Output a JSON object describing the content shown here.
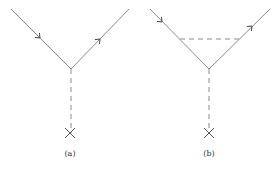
{
  "colors": {
    "line": "#8a8a8a",
    "arrow": "#444444",
    "background": "#ffffff"
  },
  "diagrams": [
    {
      "id": "a",
      "label": "(a)",
      "vertex": [
        71,
        69
      ],
      "incoming_start": [
        11,
        9
      ],
      "outgoing_end": [
        129,
        9
      ],
      "incoming_arrow_at": [
        40,
        38
      ],
      "outgoing_arrow_at": [
        100,
        39
      ],
      "vertical_dashed": {
        "from": [
          71,
          69
        ],
        "to": [
          71,
          133
        ]
      },
      "cross_at": [
        70,
        133
      ],
      "horizontal_dashed": null
    },
    {
      "id": "b",
      "label": "(b)",
      "vertex": [
        209,
        69
      ],
      "incoming_start": [
        150,
        9
      ],
      "outgoing_end": [
        270,
        9
      ],
      "incoming_arrow_at": [
        162,
        22
      ],
      "outgoing_arrow_at": [
        252,
        26
      ],
      "vertical_dashed": {
        "from": [
          209,
          69
        ],
        "to": [
          209,
          133
        ]
      },
      "cross_at": [
        209,
        133
      ],
      "horizontal_dashed": {
        "from": [
          180,
          39
        ],
        "to": [
          240,
          39
        ]
      }
    }
  ]
}
